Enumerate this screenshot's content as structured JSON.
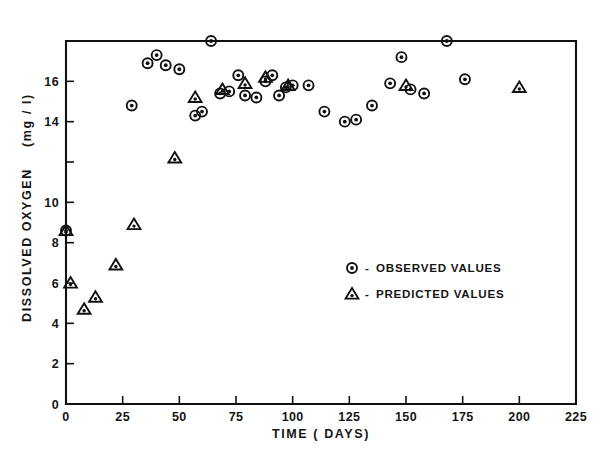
{
  "chart_data": {
    "type": "scatter",
    "title": "",
    "xlabel": "TIME  ( DAYS)",
    "ylabel_main": "DISSOLVED  OXYGEN",
    "ylabel_units": "(mg / l)",
    "xlim": [
      0,
      225
    ],
    "ylim": [
      0,
      18
    ],
    "xticks": [
      0,
      25,
      50,
      75,
      100,
      125,
      150,
      175,
      200,
      225
    ],
    "xticklabels": [
      "0",
      "25",
      "50",
      "75",
      "100",
      "125",
      "150",
      "175",
      "200",
      "225"
    ],
    "yticks": [
      0,
      2,
      4,
      6,
      8,
      10,
      12,
      14,
      16
    ],
    "yticklabels": [
      "0",
      "2",
      "4",
      "6",
      "8",
      "10",
      "12",
      "14",
      "16"
    ],
    "ytick_hidden_labels": [
      "12"
    ],
    "grid": false,
    "legend_position": "center-right",
    "series": [
      {
        "name": "OBSERVED VALUES",
        "marker": "circle-dot",
        "points": [
          [
            0,
            8.6
          ],
          [
            29,
            14.8
          ],
          [
            36,
            16.9
          ],
          [
            40,
            17.3
          ],
          [
            44,
            16.8
          ],
          [
            50,
            16.6
          ],
          [
            57,
            14.3
          ],
          [
            60,
            14.5
          ],
          [
            64,
            18.0
          ],
          [
            68,
            15.4
          ],
          [
            72,
            15.5
          ],
          [
            76,
            16.3
          ],
          [
            79,
            15.3
          ],
          [
            84,
            15.2
          ],
          [
            88,
            16.0
          ],
          [
            91,
            16.3
          ],
          [
            94,
            15.3
          ],
          [
            97,
            15.7
          ],
          [
            100,
            15.8
          ],
          [
            107,
            15.8
          ],
          [
            114,
            14.5
          ],
          [
            123,
            14.0
          ],
          [
            128,
            14.1
          ],
          [
            135,
            14.8
          ],
          [
            143,
            15.9
          ],
          [
            148,
            17.2
          ],
          [
            152,
            15.6
          ],
          [
            158,
            15.4
          ],
          [
            168,
            18.0
          ],
          [
            176,
            16.1
          ]
        ]
      },
      {
        "name": "PREDICTED VALUES",
        "marker": "triangle-dot",
        "points": [
          [
            0,
            8.6
          ],
          [
            2,
            6.0
          ],
          [
            8,
            4.7
          ],
          [
            13,
            5.3
          ],
          [
            22,
            6.9
          ],
          [
            30,
            8.9
          ],
          [
            48,
            12.2
          ],
          [
            57,
            15.2
          ],
          [
            69,
            15.6
          ],
          [
            79,
            15.9
          ],
          [
            88,
            16.2
          ],
          [
            98,
            15.8
          ],
          [
            150,
            15.8
          ],
          [
            200,
            15.7
          ]
        ]
      }
    ],
    "legend_entries": [
      {
        "marker": "circle-dot",
        "dash": "-",
        "label": "OBSERVED VALUES"
      },
      {
        "marker": "triangle-dot",
        "dash": "-",
        "label": "PREDICTED VALUES"
      }
    ]
  }
}
